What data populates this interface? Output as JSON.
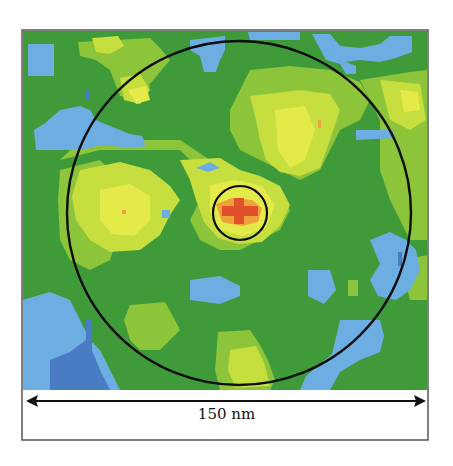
{
  "figure": {
    "colors": {
      "background_green": "#3f9a3a",
      "light_green": "#8cc43a",
      "yellow_green": "#c6de3e",
      "yellow": "#e4ea4a",
      "orange": "#f0a23a",
      "red": "#e0502a",
      "light_blue": "#6caee2",
      "dark_blue": "#4a7cc4",
      "circle_stroke": "#0d0d0d",
      "frame": "#555555"
    },
    "map": {
      "x": 22,
      "y": 30,
      "width": 406,
      "height": 360
    },
    "large_circle": {
      "cx": 239,
      "cy": 213,
      "r": 172
    },
    "small_circle": {
      "cx": 240,
      "cy": 213,
      "r": 27
    },
    "scale_bar": {
      "label": "150 nm",
      "x1": 26,
      "x2": 426,
      "y": 401
    }
  }
}
